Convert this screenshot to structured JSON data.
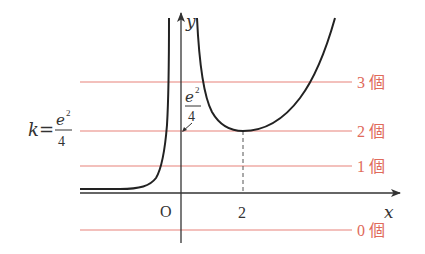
{
  "diagram": {
    "type": "function-graph",
    "axes": {
      "x_label": "x",
      "y_label": "y",
      "origin_label": "O",
      "x_tick_labels": [
        "2"
      ]
    },
    "annotations": {
      "k_label_prefix": "k=",
      "k_fraction_numerator": "e",
      "k_fraction_exponent": "2",
      "k_fraction_denominator": "4",
      "axis_fraction_numerator": "e",
      "axis_fraction_exponent": "2",
      "axis_fraction_denominator": "4"
    },
    "horizontal_lines": [
      {
        "count_label": "3 個",
        "level": "above e^2/4"
      },
      {
        "count_label": "2 個",
        "level": "e^2/4"
      },
      {
        "count_label": "1 個",
        "level": "between 0 and e^2/4"
      },
      {
        "count_label": "0 個",
        "level": "below 0"
      }
    ],
    "colors": {
      "curve": "#222222",
      "axes": "#333333",
      "lines": "#e8827a",
      "labels": "#e06a5a"
    }
  }
}
